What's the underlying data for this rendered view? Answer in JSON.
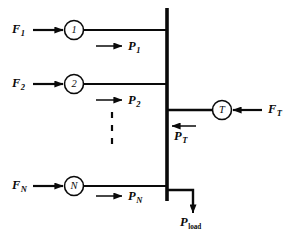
{
  "diagram": {
    "ink_color": "#0a0a0a",
    "background": "#ffffff",
    "bus": {
      "label": "bus-bar",
      "x": 167,
      "y_top": 8,
      "y_bottom": 201,
      "stroke_width": 3.6
    },
    "feeders": [
      {
        "id": "feeder-1",
        "input_label": "F",
        "input_sub": "1",
        "node_label": "1",
        "flow_label": "P",
        "flow_sub": "1",
        "line_y": 30,
        "node_cx": 74,
        "node_cy": 30,
        "node_r": 9.5,
        "input_x": 12,
        "input_y": 23,
        "arrow_x1": 33,
        "arrow_x2": 63,
        "flow_arrow_x1": 96,
        "flow_arrow_x2": 122,
        "flow_arrow_y": 46,
        "flow_label_x": 128,
        "flow_label_y": 40
      },
      {
        "id": "feeder-2",
        "input_label": "F",
        "input_sub": "2",
        "node_label": "2",
        "flow_label": "P",
        "flow_sub": "2",
        "line_y": 84,
        "node_cx": 74,
        "node_cy": 84,
        "node_r": 9.5,
        "input_x": 12,
        "input_y": 77,
        "arrow_x1": 33,
        "arrow_x2": 63,
        "flow_arrow_x1": 96,
        "flow_arrow_x2": 122,
        "flow_arrow_y": 100,
        "flow_label_x": 128,
        "flow_label_y": 94
      },
      {
        "id": "feeder-n",
        "input_label": "F",
        "input_sub": "N",
        "node_label": "N",
        "flow_label": "P",
        "flow_sub": "N",
        "line_y": 186,
        "node_cx": 74,
        "node_cy": 186,
        "node_r": 9.5,
        "input_x": 12,
        "input_y": 179,
        "arrow_x1": 33,
        "arrow_x2": 63,
        "flow_arrow_x1": 96,
        "flow_arrow_x2": 122,
        "flow_arrow_y": 196,
        "flow_label_x": 128,
        "flow_label_y": 190
      }
    ],
    "ellipsis": {
      "label": "vertical-ellipsis",
      "x": 112,
      "y_top": 112,
      "y_bottom": 146,
      "dashes": "6 7"
    },
    "tie_line": {
      "id": "tie-line-t",
      "node_label": "T",
      "node_cx": 222,
      "node_cy": 110,
      "node_r": 9.5,
      "line_y": 110,
      "line_x1": 167,
      "line_x2": 212,
      "source_label": "F",
      "source_sub": "T",
      "source_x": 268,
      "source_y": 103,
      "source_arrow_x1": 262,
      "source_arrow_x2": 233,
      "flow_label": "P",
      "flow_sub": "T",
      "flow_arrow_x1": 196,
      "flow_arrow_x2": 172,
      "flow_arrow_y": 126,
      "flow_label_x": 174,
      "flow_label_y": 130
    },
    "load": {
      "id": "load-branch",
      "label": "P",
      "sub": "load",
      "stub_x1": 167,
      "stub_x2": 193,
      "stub_y": 190,
      "arrow_x": 193,
      "arrow_y1": 190,
      "arrow_y2": 213,
      "label_x": 180,
      "label_y": 216
    }
  }
}
